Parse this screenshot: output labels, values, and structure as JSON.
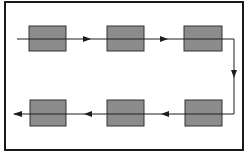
{
  "diagram": {
    "type": "serpentine-process-flow",
    "colors": {
      "box_fill": "#8c8c8c",
      "stroke": "#1e1e1e",
      "background": "#ffffff"
    },
    "top_row": {
      "boxes": 3,
      "direction": "left-to-right"
    },
    "bottom_row": {
      "boxes": 3,
      "direction": "right-to-left"
    },
    "labels": []
  }
}
